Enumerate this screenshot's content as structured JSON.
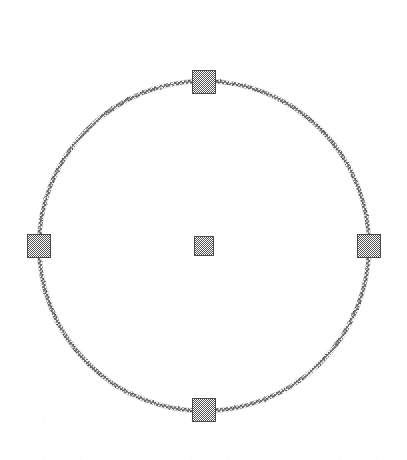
{
  "canvas": {
    "width": 407,
    "height": 460,
    "background_color": "#ffffff",
    "label": "drawing canvas"
  },
  "shape": {
    "type": "circle",
    "name": "selected-circle",
    "center_x": 204,
    "center_y": 246,
    "radius": 165,
    "stroke_color": "#7d7d7d",
    "stroke_width": 3,
    "fill": "none",
    "stroke_style": "dithered-gray"
  },
  "selection": {
    "state": "selected",
    "handle_fill_color": "#6e6e6e",
    "handle_border_color": "#4a4a4a",
    "edge_handle_size": 24,
    "center_handle_size": 20,
    "handles": [
      {
        "id": "top",
        "name": "resize-handle-top",
        "x": 204,
        "y": 82,
        "size": 24
      },
      {
        "id": "right",
        "name": "resize-handle-right",
        "x": 369,
        "y": 246,
        "size": 24
      },
      {
        "id": "bottom",
        "name": "resize-handle-bottom",
        "x": 204,
        "y": 410,
        "size": 24
      },
      {
        "id": "left",
        "name": "resize-handle-left",
        "x": 39,
        "y": 246,
        "size": 24
      },
      {
        "id": "center",
        "name": "center-anchor-handle",
        "x": 204,
        "y": 246,
        "size": 20
      }
    ]
  }
}
